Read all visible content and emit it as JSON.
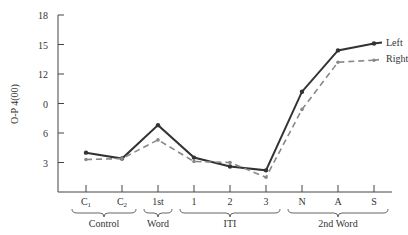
{
  "chart_data": {
    "type": "line",
    "title": "",
    "xlabel": "",
    "ylabel": "O-P 4(00)",
    "ylim": [
      0,
      18
    ],
    "yticks": [
      3,
      6,
      0,
      12,
      15,
      18
    ],
    "ytick_values": [
      3,
      6,
      9,
      12,
      15,
      18
    ],
    "ytick_labels": [
      "3",
      "6",
      "0",
      "12",
      "15",
      "18"
    ],
    "grid": false,
    "legend_position": "inline-right",
    "categories": [
      "C1",
      "C2",
      "1st",
      "1",
      "2",
      "3",
      "N",
      "A",
      "S"
    ],
    "category_labels": [
      {
        "main": "C",
        "sub": "1"
      },
      {
        "main": "C",
        "sub": "2"
      },
      {
        "main": "1st",
        "sub": ""
      },
      {
        "main": "1",
        "sub": ""
      },
      {
        "main": "2",
        "sub": ""
      },
      {
        "main": "3",
        "sub": ""
      },
      {
        "main": "N",
        "sub": ""
      },
      {
        "main": "A",
        "sub": ""
      },
      {
        "main": "S",
        "sub": ""
      }
    ],
    "groups": [
      {
        "label": "Control",
        "from": 0,
        "to": 1
      },
      {
        "label": "Word",
        "from": 2,
        "to": 2
      },
      {
        "label": "ITI",
        "from": 3,
        "to": 5
      },
      {
        "label": "2nd Word",
        "from": 6,
        "to": 8
      }
    ],
    "series": [
      {
        "name": "Left",
        "style": "solid",
        "color": "#333333",
        "values": [
          4.0,
          3.4,
          6.8,
          3.5,
          2.6,
          2.2,
          10.2,
          14.4,
          15.1
        ]
      },
      {
        "name": "Right",
        "style": "dashed",
        "color": "#888888",
        "values": [
          3.3,
          3.4,
          5.3,
          3.1,
          3.0,
          1.5,
          8.4,
          13.2,
          13.4
        ]
      }
    ]
  }
}
